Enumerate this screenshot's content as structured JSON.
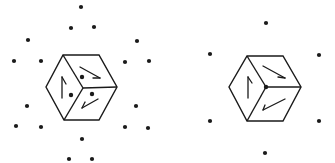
{
  "figure": {
    "stroke_color": "#1a1a1a",
    "background": "#ffffff",
    "panels": [
      {
        "id": "left",
        "cube": {
          "hexagon": [
            [
              63,
              55
            ],
            [
              99,
              55
            ],
            [
              117,
              87
            ],
            [
              99,
              120
            ],
            [
              64,
              120
            ],
            [
              46,
              87
            ]
          ],
          "center": [
            83,
            88
          ],
          "arrows": [
            {
              "face": "left",
              "line": [
                [
                  62,
                  98
                ],
                [
                  62,
                  77
                ]
              ],
              "hook": [
                [
                  62,
                  77
                ],
                [
                  66,
                  84
                ]
              ]
            },
            {
              "face": "top",
              "line": [
                [
                  80,
                  67
                ],
                [
                  100,
                  78
                ]
              ],
              "hook": [
                [
                  100,
                  78
                ],
                [
                  93,
                  78
                ]
              ]
            },
            {
              "face": "bottom",
              "line": [
                [
                  98,
                  99
                ],
                [
                  82,
                  108
                ]
              ],
              "hook": [
                [
                  82,
                  108
                ],
                [
                  85,
                  102
                ]
              ]
            }
          ],
          "inner_dots": [
            [
              82,
              77
            ],
            [
              71,
              95
            ],
            [
              92,
              94
            ]
          ]
        },
        "dots": [
          [
            81,
            7
          ],
          [
            71,
            28
          ],
          [
            94,
            27
          ],
          [
            28,
            40
          ],
          [
            137,
            41
          ],
          [
            14,
            61
          ],
          [
            41,
            61
          ],
          [
            125,
            62
          ],
          [
            149,
            61
          ],
          [
            27,
            106
          ],
          [
            136,
            106
          ],
          [
            16,
            126
          ],
          [
            41,
            127
          ],
          [
            125,
            127
          ],
          [
            148,
            128
          ],
          [
            82,
            139
          ],
          [
            69,
            159
          ],
          [
            92,
            159
          ]
        ]
      },
      {
        "id": "right",
        "cube": {
          "hexagon": [
            [
              247,
              56
            ],
            [
              283,
              56
            ],
            [
              301,
              87
            ],
            [
              283,
              121
            ],
            [
              247,
              121
            ],
            [
              229,
              87
            ]
          ],
          "center": [
            266,
            87
          ],
          "arrows": [
            {
              "face": "left",
              "line": [
                [
                  248,
                  98
                ],
                [
                  248,
                  77
                ]
              ],
              "hook": [
                [
                  248,
                  77
                ],
                [
                  252,
                  83
                ]
              ]
            },
            {
              "face": "top",
              "line": [
                [
                  263,
                  66
                ],
                [
                  285,
                  78
                ]
              ],
              "hook": [
                [
                  285,
                  78
                ],
                [
                  278,
                  77
                ]
              ]
            },
            {
              "face": "bottom",
              "line": [
                [
                  285,
                  99
                ],
                [
                  263,
                  110
                ]
              ],
              "hook": [
                [
                  263,
                  110
                ],
                [
                  265,
                  105
                ]
              ]
            }
          ],
          "inner_dots": [
            [
              266,
              87
            ]
          ]
        },
        "dots": [
          [
            266,
            23
          ],
          [
            210,
            54
          ],
          [
            319,
            55
          ],
          [
            210,
            121
          ],
          [
            319,
            121
          ],
          [
            265,
            153
          ]
        ]
      }
    ]
  }
}
